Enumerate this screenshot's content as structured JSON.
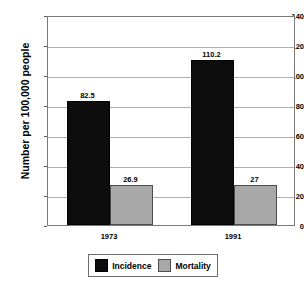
{
  "chart_data": {
    "type": "bar",
    "title": "",
    "subtitle": "",
    "xlabel": "",
    "ylabel": "Number per 100,000 people",
    "categories": [
      "1973",
      "1991"
    ],
    "series": [
      {
        "name": "Incidence",
        "color": "#0d0d0d",
        "values": [
          82.5,
          110.2
        ],
        "labels": [
          "82.5",
          "110.2"
        ]
      },
      {
        "name": "Mortality",
        "color": "#a8a8a8",
        "values": [
          26.9,
          27
        ],
        "labels": [
          "26.9",
          "27"
        ]
      }
    ],
    "ylim": [
      0,
      140
    ],
    "ytick_step": 20,
    "ytick_labels": [
      "0",
      "20",
      "40",
      "60",
      "80",
      "100",
      "120",
      "140"
    ],
    "grid": true,
    "legend_position": "bottom"
  },
  "legend": {
    "entries": [
      {
        "label": "Incidence",
        "swatch": "incidence-swatch"
      },
      {
        "label": "Mortality",
        "swatch": "mortality-swatch"
      }
    ]
  },
  "colors": {
    "incidence": "#0d0d0d",
    "mortality": "#a8a8a8",
    "gridline": "#b0b0b0",
    "frame": "#7a7a7a",
    "background": "#ffffff"
  }
}
